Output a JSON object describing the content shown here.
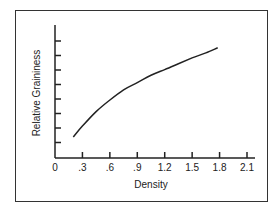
{
  "chart_data": {
    "type": "line",
    "title": "",
    "xlabel": "Density",
    "ylabel": "Relative Graininess",
    "x_tick_labels": [
      "0",
      ".3",
      ".6",
      ".9",
      "1.2",
      "1.5",
      "1.8",
      "2.1"
    ],
    "x_ticks": [
      0,
      0.3,
      0.6,
      0.9,
      1.2,
      1.5,
      1.8,
      2.1
    ],
    "y_tick_count": 8,
    "y_tick_labels": [],
    "xlim": [
      0,
      2.1
    ],
    "ylim": [
      0,
      9
    ],
    "grid": false,
    "legend": null,
    "series": [
      {
        "name": "Relative Graininess",
        "x": [
          0.2,
          0.3,
          0.45,
          0.6,
          0.75,
          0.9,
          1.05,
          1.2,
          1.35,
          1.5,
          1.65,
          1.78
        ],
        "y": [
          1.45,
          2.2,
          3.2,
          4.0,
          4.7,
          5.2,
          5.7,
          6.1,
          6.5,
          6.9,
          7.25,
          7.6
        ]
      }
    ]
  }
}
